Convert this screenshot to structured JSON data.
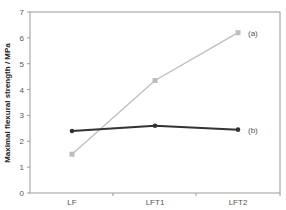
{
  "chart_data": {
    "type": "line",
    "title": "",
    "xlabel": "",
    "ylabel": "Maximal flexural strength / MPa",
    "categories": [
      "LF",
      "LFT1",
      "LFT2"
    ],
    "series": [
      {
        "name": "(a)",
        "values": [
          1.5,
          4.35,
          6.2
        ],
        "color": "#bdbdbd",
        "marker": "square"
      },
      {
        "name": "(b)",
        "values": [
          2.4,
          2.6,
          2.45
        ],
        "color": "#333333",
        "marker": "diamond"
      }
    ],
    "ylim": [
      0,
      7
    ],
    "yticks": [
      0,
      1,
      2,
      3,
      4,
      5,
      6,
      7
    ],
    "grid": false,
    "legend_position": "inline-right"
  },
  "labels": {
    "ytick_labels": [
      "0",
      "1",
      "2",
      "3",
      "4",
      "5",
      "6",
      "7"
    ],
    "series_a_label": "(a)",
    "series_b_label": "(b)",
    "x_labels": [
      "LF",
      "LFT1",
      "LFT2"
    ]
  }
}
